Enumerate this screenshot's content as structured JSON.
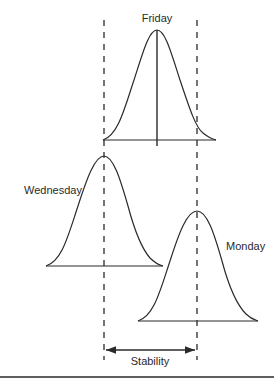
{
  "diagram": {
    "type": "distribution-shift",
    "curves": [
      {
        "name": "friday",
        "label": "Friday",
        "mean_x": 157,
        "peak_y": 30,
        "baseline_y": 140,
        "x_start": 103,
        "x_end": 216,
        "mean_line": true
      },
      {
        "name": "wednesday",
        "label": "Wednesday",
        "mean_x": 104,
        "peak_y": 156,
        "baseline_y": 266,
        "x_start": 46,
        "x_end": 163
      },
      {
        "name": "monday",
        "label": "Monday",
        "mean_x": 197,
        "peak_y": 211,
        "baseline_y": 321,
        "x_start": 138,
        "x_end": 258
      }
    ],
    "dashed_lines": [
      {
        "x": 104
      },
      {
        "x": 197
      }
    ],
    "span_arrow": {
      "label": "Stability",
      "x1": 105,
      "x2": 196,
      "y": 350
    },
    "colors": {
      "stroke": "#2a2a2a",
      "background": "#ffffff"
    }
  }
}
